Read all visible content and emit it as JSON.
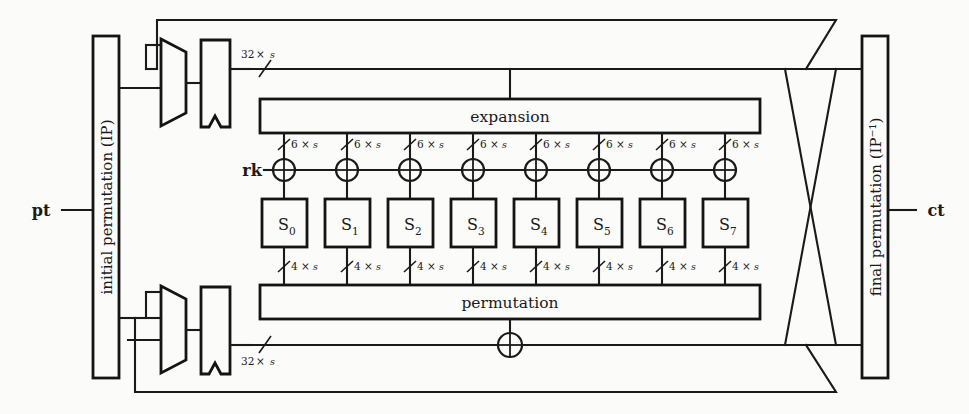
{
  "diagram": {
    "io": {
      "plaintext_label": "pt",
      "ciphertext_label": "ct",
      "roundkey_label": "rk"
    },
    "blocks": {
      "initial_permutation": "initial permutation (IP)",
      "final_permutation": "final permutation (IP⁻¹)",
      "expansion": "expansion",
      "permutation": "permutation"
    },
    "sboxes": [
      {
        "base": "S",
        "sub": "0"
      },
      {
        "base": "S",
        "sub": "1"
      },
      {
        "base": "S",
        "sub": "2"
      },
      {
        "base": "S",
        "sub": "3"
      },
      {
        "base": "S",
        "sub": "4"
      },
      {
        "base": "S",
        "sub": "5"
      },
      {
        "base": "S",
        "sub": "6"
      },
      {
        "base": "S",
        "sub": "7"
      }
    ],
    "bus_labels": {
      "top_left_bus": {
        "count": "32",
        "times": "×",
        "unit": "s"
      },
      "bottom_left_bus": {
        "count": "32",
        "times": "×",
        "unit": "s"
      },
      "expansion_out": {
        "count": "6",
        "times": "×",
        "unit": "s"
      },
      "sbox_out": {
        "count": "4",
        "times": "×",
        "unit": "s"
      }
    },
    "expansion_bus_labels": [
      {
        "count": "6",
        "times": "×",
        "unit": "s"
      },
      {
        "count": "6",
        "times": "×",
        "unit": "s"
      },
      {
        "count": "6",
        "times": "×",
        "unit": "s"
      },
      {
        "count": "6",
        "times": "×",
        "unit": "s"
      },
      {
        "count": "6",
        "times": "×",
        "unit": "s"
      },
      {
        "count": "6",
        "times": "×",
        "unit": "s"
      },
      {
        "count": "6",
        "times": "×",
        "unit": "s"
      },
      {
        "count": "6",
        "times": "×",
        "unit": "s"
      }
    ],
    "sbox_bus_labels": [
      {
        "count": "4",
        "times": "×",
        "unit": "s"
      },
      {
        "count": "4",
        "times": "×",
        "unit": "s"
      },
      {
        "count": "4",
        "times": "×",
        "unit": "s"
      },
      {
        "count": "4",
        "times": "×",
        "unit": "s"
      },
      {
        "count": "4",
        "times": "×",
        "unit": "s"
      },
      {
        "count": "4",
        "times": "×",
        "unit": "s"
      },
      {
        "count": "4",
        "times": "×",
        "unit": "s"
      },
      {
        "count": "4",
        "times": "×",
        "unit": "s"
      }
    ],
    "components": {
      "mux_top": "multiplexer",
      "mux_bottom": "multiplexer",
      "register_top": "register",
      "register_bottom": "register",
      "xor_bottom": "xor"
    },
    "colors": {
      "ink": "#1a1a1a",
      "paper": "#fbfbfa"
    }
  }
}
